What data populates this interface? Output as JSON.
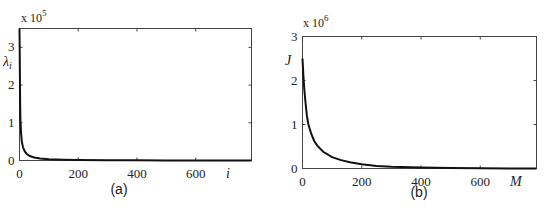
{
  "chart_data": [
    {
      "type": "line",
      "panel_label": "(a)",
      "title": "",
      "xlabel": "i",
      "ylabel": "λi",
      "y_multiplier": "x 10^5",
      "y_multiplier_base": "x 10",
      "y_multiplier_exp": "5",
      "xlim": [
        0,
        790
      ],
      "ylim": [
        0,
        3.5
      ],
      "xticks": [
        0,
        200,
        400,
        600
      ],
      "yticks": [
        0,
        1,
        2,
        3
      ],
      "grid": false,
      "series": [
        {
          "name": "eigenvalues",
          "x": [
            0,
            1,
            2,
            3,
            5,
            8,
            12,
            18,
            25,
            35,
            50,
            70,
            100,
            150,
            200,
            300,
            400,
            500,
            600,
            700,
            790
          ],
          "values": [
            3.5,
            2.6,
            1.6,
            1.1,
            0.75,
            0.5,
            0.35,
            0.24,
            0.17,
            0.12,
            0.08,
            0.055,
            0.035,
            0.02,
            0.013,
            0.007,
            0.004,
            0.003,
            0.002,
            0.0015,
            0.001
          ]
        }
      ]
    },
    {
      "type": "line",
      "panel_label": "(b)",
      "title": "",
      "xlabel": "M",
      "ylabel": "J",
      "y_multiplier": "x 10^6",
      "y_multiplier_base": "x 10",
      "y_multiplier_exp": "6",
      "xlim": [
        0,
        790
      ],
      "ylim": [
        0,
        3
      ],
      "xticks": [
        0,
        200,
        400,
        600
      ],
      "yticks": [
        0,
        1,
        2,
        3
      ],
      "grid": false,
      "series": [
        {
          "name": "J",
          "x": [
            0,
            3,
            6,
            10,
            15,
            20,
            30,
            40,
            50,
            70,
            100,
            130,
            160,
            200,
            250,
            300,
            400,
            500,
            600,
            700,
            790
          ],
          "values": [
            2.5,
            2.1,
            1.8,
            1.5,
            1.2,
            1.0,
            0.78,
            0.62,
            0.52,
            0.38,
            0.26,
            0.19,
            0.14,
            0.095,
            0.06,
            0.04,
            0.02,
            0.01,
            0.005,
            0.002,
            0.0005
          ]
        }
      ]
    }
  ]
}
